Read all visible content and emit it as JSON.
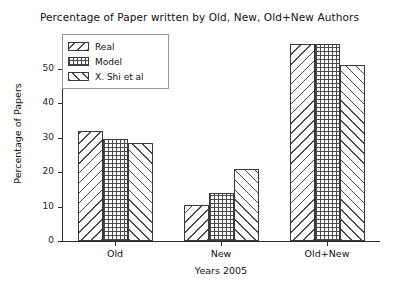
{
  "chart_data": {
    "type": "bar",
    "title": "Percentage of Paper written by Old, New, Old+New Authors",
    "xlabel": "Years 2005",
    "ylabel": "Percentage of Papers",
    "categories": [
      "Old",
      "New",
      "Old+New"
    ],
    "series": [
      {
        "name": "Real",
        "values": [
          32.0,
          10.5,
          57.0
        ],
        "hatch": "\\"
      },
      {
        "name": "Model",
        "values": [
          29.5,
          14.0,
          57.0
        ],
        "hatch": "+"
      },
      {
        "name": "X. Shi et al",
        "values": [
          28.5,
          21.0,
          51.0
        ],
        "hatch": "/"
      }
    ],
    "ylim": [
      0,
      60
    ],
    "yticks": [
      0,
      10,
      20,
      30,
      40,
      50
    ],
    "ytick_labels": [
      "0",
      "10",
      "20",
      "30",
      "40",
      "50"
    ],
    "grid": false,
    "legend_position": "upper left",
    "bar_face_color": "#ffffff",
    "bar_edge_color": "#3a3a3a",
    "hatch_color": "#4a4a4a",
    "axis_color": "#2b2b2b",
    "background_color": "#ffffff"
  }
}
